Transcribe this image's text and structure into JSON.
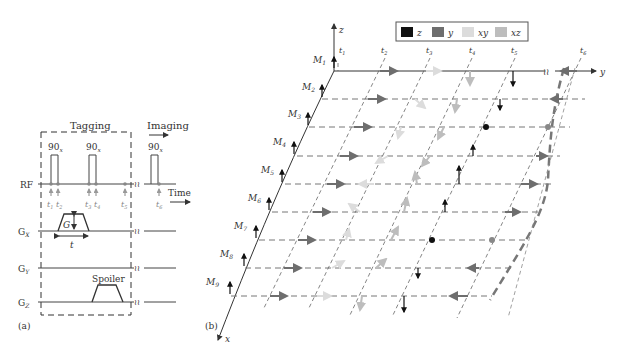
{
  "panel_a": {
    "label": "(a)",
    "tagging_label": "Tagging",
    "imaging_label": "Imaging",
    "time_label": "Time",
    "pulse_label": "90",
    "pulse_sub": "x",
    "rows": [
      "RF",
      "G",
      "G",
      "G"
    ],
    "row_subs": [
      "",
      "X",
      "Y",
      "Z"
    ],
    "gradient_label": "G",
    "duration_label": "t",
    "spoiler_label": "Spoiler",
    "time_points": [
      "t",
      "t",
      "t",
      "t",
      "t",
      "t"
    ],
    "time_subs": [
      "1",
      "2",
      "3",
      "4",
      "5",
      "6"
    ]
  },
  "panel_b": {
    "label": "(b)",
    "axis_z": "z",
    "axis_y": "y",
    "axis_x": "x",
    "legend": [
      {
        "label": "z",
        "color": "#111111"
      },
      {
        "label": "y",
        "color": "#6e6e6e"
      },
      {
        "label": "xy",
        "color": "#dcdcdc"
      },
      {
        "label": "xz",
        "color": "#bdbdbd"
      }
    ],
    "magnetizations": [
      "M",
      "M",
      "M",
      "M",
      "M",
      "M",
      "M",
      "M",
      "M"
    ],
    "mag_subs": [
      "1",
      "2",
      "3",
      "4",
      "5",
      "6",
      "7",
      "8",
      "9"
    ],
    "time_points": [
      "t",
      "t",
      "t",
      "t",
      "t",
      "t"
    ],
    "time_subs": [
      "1",
      "2",
      "3",
      "4",
      "5",
      "6"
    ]
  }
}
